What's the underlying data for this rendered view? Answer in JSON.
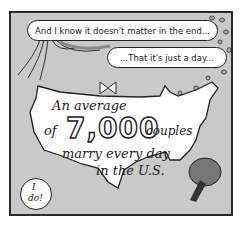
{
  "comic": {
    "speech_bubbles": [
      {
        "text": "And I know it doesn't matter in the end..."
      },
      {
        "text": "...That it's just a day..."
      }
    ],
    "map_caption": {
      "line1": "An average",
      "line2_prefix": "of",
      "number": "7,000",
      "line2_suffix": "couples",
      "line3": "marry every day",
      "line4": "in the U.S."
    },
    "small_bubble": {
      "line1": "I",
      "line2": "do!"
    },
    "colors": {
      "background": "#c9c9c9",
      "map": "#ffffff",
      "outline": "#222222"
    }
  }
}
